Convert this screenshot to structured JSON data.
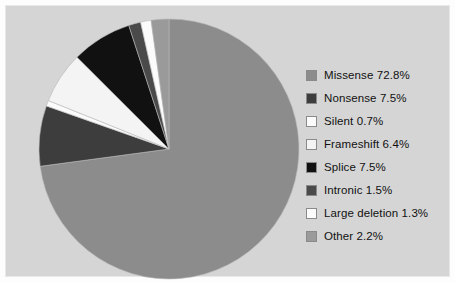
{
  "chart_data": {
    "type": "pie",
    "title": "",
    "subtitle": "",
    "xlabel": "",
    "ylabel": "",
    "legend_position": "right",
    "grid": false,
    "start_angle_deg": 0,
    "direction": "clockwise",
    "categories": [
      "Missense",
      "Nonsense",
      "Silent",
      "Frameshift",
      "Splice",
      "Intronic",
      "Large deletion",
      "Other"
    ],
    "values": [
      72.8,
      7.5,
      0.7,
      6.4,
      7.5,
      1.5,
      1.3,
      2.2
    ],
    "value_unit": "%",
    "colors": [
      "#8c8c8c",
      "#3d3d3d",
      "#fbfbfb",
      "#f4f4f4",
      "#111111",
      "#4a4a4a",
      "#fbfbfb",
      "#9a9a9a"
    ],
    "slices": [
      {
        "label": "Missense",
        "value": 72.8,
        "color": "#8c8c8c"
      },
      {
        "label": "Nonsense",
        "value": 7.5,
        "color": "#3d3d3d"
      },
      {
        "label": "Silent",
        "value": 0.7,
        "color": "#fbfbfb"
      },
      {
        "label": "Frameshift",
        "value": 6.4,
        "color": "#f4f4f4"
      },
      {
        "label": "Splice",
        "value": 7.5,
        "color": "#111111"
      },
      {
        "label": "Intronic",
        "value": 1.5,
        "color": "#4a4a4a"
      },
      {
        "label": "Large deletion",
        "value": 1.3,
        "color": "#fbfbfb"
      },
      {
        "label": "Other",
        "value": 2.2,
        "color": "#9a9a9a"
      }
    ]
  },
  "legend": {
    "entries": [
      {
        "label": "Missense 72.8%",
        "color": "#8c8c8c"
      },
      {
        "label": "Nonsense 7.5%",
        "color": "#3d3d3d"
      },
      {
        "label": "Silent 0.7%",
        "color": "#fbfbfb"
      },
      {
        "label": "Frameshift 6.4%",
        "color": "#f4f4f4"
      },
      {
        "label": "Splice 7.5%",
        "color": "#111111"
      },
      {
        "label": "Intronic 1.5%",
        "color": "#4a4a4a"
      },
      {
        "label": "Large deletion 1.3%",
        "color": "#fbfbfb"
      },
      {
        "label": "Other 2.2%",
        "color": "#9a9a9a"
      }
    ]
  },
  "panel": {
    "background_color": "#d5d5d5",
    "border_color": "#e8e8e8"
  }
}
